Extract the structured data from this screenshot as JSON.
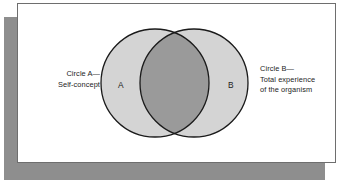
{
  "figure": {
    "type": "venn-diagram",
    "title": "",
    "background_color": "#ffffff",
    "panel_color": "#ffffff",
    "panel_border_color": "#6e6e6e",
    "shadow_color": "#8e8e8e",
    "circle_fill_color": "#d4d4d4",
    "overlap_fill_color": "#9a9a9a",
    "circle_stroke_color": "#1a1a1a",
    "text_color": "#1c1c1c"
  },
  "circles": [
    {
      "id": "A",
      "letter": "A",
      "label_lines": [
        "Circle A—",
        "Self-concept"
      ],
      "label_line1": "Circle A—",
      "label_line2": "Self-concept",
      "label_side": "left",
      "cx": 155,
      "cy": 83,
      "r": 54
    },
    {
      "id": "B",
      "letter": "B",
      "label_lines": [
        "Circle B—",
        "Total experience",
        "of the organism"
      ],
      "label_line1": "Circle B—",
      "label_line2": "Total experience",
      "label_line3": "of the organism",
      "label_side": "right",
      "cx": 194,
      "cy": 83,
      "r": 54
    }
  ],
  "overlap": {
    "description": "shared region between Circle A and Circle B",
    "fill": "#9a9a9a"
  }
}
